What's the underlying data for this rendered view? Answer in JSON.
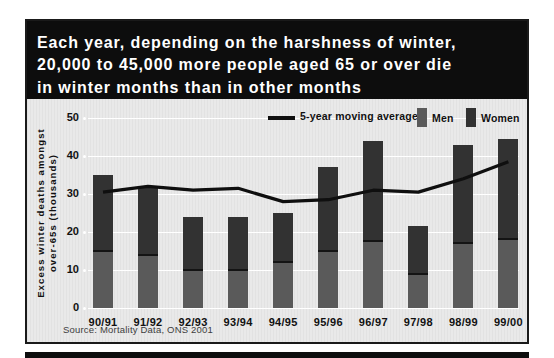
{
  "header": {
    "title_lines": [
      "Each year, depending on the harshness of winter,",
      "20,000 to 45,000 more people aged 65 or over die",
      "in winter months than in other months"
    ]
  },
  "legend": {
    "moving_average_label": "5-year moving average",
    "men_label": "Men",
    "women_label": "Women"
  },
  "chart_data": {
    "type": "bar",
    "stacked": true,
    "categories": [
      "90/91",
      "91/92",
      "92/93",
      "93/94",
      "94/95",
      "95/96",
      "96/97",
      "97/98",
      "98/99",
      "99/00"
    ],
    "series": [
      {
        "name": "Men",
        "color": "#5a5a5a",
        "values": [
          15,
          14,
          10,
          10,
          12,
          15,
          17.5,
          9,
          17,
          18
        ]
      },
      {
        "name": "Women",
        "color": "#323232",
        "values": [
          20,
          18,
          14,
          14,
          13,
          22,
          26.5,
          12.5,
          26,
          26.5
        ]
      }
    ],
    "line_series": {
      "name": "5-year moving average",
      "color": "#0f0f0f",
      "values": [
        30.5,
        32,
        31,
        31.5,
        28,
        28.5,
        31,
        30.5,
        34,
        38.5
      ]
    },
    "ylabel_lines": [
      "Excess winter deaths amongst",
      "over-65s (thousands)"
    ],
    "ylim": [
      0,
      50
    ],
    "yticks": [
      0,
      10,
      20,
      30,
      40,
      50
    ],
    "grid": "horizontal-white",
    "legend_position": "top"
  },
  "source": {
    "text": "Source: Mortality Data, ONS 2001"
  },
  "colors": {
    "title_bg": "#0d0d0d",
    "title_text": "#ffffff",
    "panel_bg": "#e9e9e9",
    "men_bar": "#5a5a5a",
    "women_bar": "#323232",
    "moving_average_line": "#0f0f0f",
    "gridline": "#ffffff",
    "axis_text": "#111111",
    "source_text": "#3d3d3d"
  }
}
